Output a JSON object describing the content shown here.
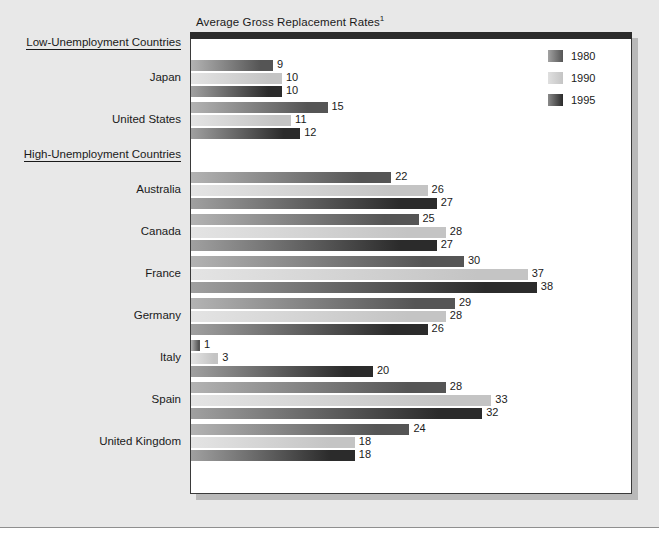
{
  "chart_data": {
    "type": "bar",
    "orientation": "horizontal",
    "title": "Average Gross Replacement Rates",
    "title_footnote_marker": "1",
    "xlabel": "",
    "ylabel": "",
    "xlim": [
      0,
      45
    ],
    "grid": false,
    "legend_position": "top-right",
    "series": [
      {
        "name": "1980",
        "color": "#555555",
        "values": [
          9,
          15,
          22,
          25,
          30,
          29,
          1,
          28,
          24
        ]
      },
      {
        "name": "1990",
        "color": "#c4c4c4",
        "values": [
          10,
          11,
          26,
          28,
          37,
          28,
          3,
          33,
          18
        ]
      },
      {
        "name": "1995",
        "color": "#2b2b2b",
        "values": [
          10,
          12,
          27,
          27,
          38,
          26,
          20,
          32,
          18
        ]
      }
    ],
    "categories": [
      "Japan",
      "United States",
      "Australia",
      "Canada",
      "France",
      "Germany",
      "Italy",
      "Spain",
      "United Kingdom"
    ],
    "groups": [
      {
        "header": "Low-Unemployment Countries",
        "categories": [
          "Japan",
          "United States"
        ]
      },
      {
        "header": "High-Unemployment Countries",
        "categories": [
          "Australia",
          "Canada",
          "France",
          "Germany",
          "Italy",
          "Spain",
          "United Kingdom"
        ]
      }
    ],
    "rows": [
      {
        "country": "Japan",
        "group": "Low-Unemployment Countries",
        "1980": 9,
        "1990": 10,
        "1995": 10
      },
      {
        "country": "United States",
        "group": "Low-Unemployment Countries",
        "1980": 15,
        "1990": 11,
        "1995": 12
      },
      {
        "country": "Australia",
        "group": "High-Unemployment Countries",
        "1980": 22,
        "1990": 26,
        "1995": 27
      },
      {
        "country": "Canada",
        "group": "High-Unemployment Countries",
        "1980": 25,
        "1990": 28,
        "1995": 27
      },
      {
        "country": "France",
        "group": "High-Unemployment Countries",
        "1980": 30,
        "1990": 37,
        "1995": 38
      },
      {
        "country": "Germany",
        "group": "High-Unemployment Countries",
        "1980": 29,
        "1990": 28,
        "1995": 26
      },
      {
        "country": "Italy",
        "group": "High-Unemployment Countries",
        "1980": 1,
        "1990": 3,
        "1995": 20
      },
      {
        "country": "Spain",
        "group": "High-Unemployment Countries",
        "1980": 28,
        "1990": 33,
        "1995": 32
      },
      {
        "country": "United Kingdom",
        "group": "High-Unemployment Countries",
        "1980": 24,
        "1990": 18,
        "1995": 18
      }
    ]
  },
  "legend": {
    "items": [
      {
        "label": "1980",
        "color": "#555555"
      },
      {
        "label": "1990",
        "color": "#c4c4c4"
      },
      {
        "label": "1995",
        "color": "#2b2b2b"
      }
    ]
  },
  "colors": {
    "background": "#e8e8e8",
    "plot_background": "#ffffff",
    "frame": "#3a3a3a",
    "text": "#1a1a1a",
    "series_1980": "#555555",
    "series_1990": "#c4c4c4",
    "series_1995": "#2b2b2b"
  },
  "layout": {
    "pixels_per_unit": 9.1,
    "row_height": 42,
    "group_header_height": 26
  }
}
